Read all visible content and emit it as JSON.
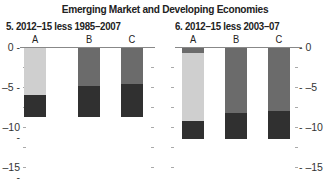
{
  "title": "Emerging Market and Developing Economies",
  "colors": {
    "light": "#cfcfcf",
    "mid": "#6b6b6b",
    "dark": "#303030",
    "axis": "#888888"
  },
  "chart_data": [
    {
      "type": "bar",
      "stacked": true,
      "title": "5. 2012–15 less 1985–2007",
      "categories": [
        "A",
        "B",
        "C"
      ],
      "ylim": [
        -15,
        0
      ],
      "yticks": [
        0,
        -5,
        -10,
        -15
      ],
      "axis_side": "left",
      "series": [
        {
          "name": "mid-gray component",
          "values": [
            0,
            -4.9,
            -4.6
          ]
        },
        {
          "name": "light component",
          "values": [
            -6.0,
            0,
            0
          ]
        },
        {
          "name": "dark component",
          "values": [
            -2.75,
            -3.85,
            -4.15
          ]
        }
      ],
      "totals": [
        -8.75,
        -8.75,
        -8.75
      ]
    },
    {
      "type": "bar",
      "stacked": true,
      "title": "6. 2012–15 less 2003–07",
      "categories": [
        "A",
        "B",
        "C"
      ],
      "ylim": [
        -15,
        0
      ],
      "yticks": [
        0,
        -5,
        -10,
        -15
      ],
      "axis_side": "right",
      "series": [
        {
          "name": "mid-gray component",
          "values": [
            -0.75,
            -8.25,
            -8.0
          ]
        },
        {
          "name": "light component",
          "values": [
            -8.5,
            0,
            0
          ]
        },
        {
          "name": "dark component",
          "values": [
            -2.25,
            -3.25,
            -3.5
          ]
        }
      ],
      "totals": [
        -11.5,
        -11.5,
        -11.5
      ]
    }
  ],
  "tick_labels": [
    "0",
    "–5",
    "–10",
    "–15"
  ]
}
